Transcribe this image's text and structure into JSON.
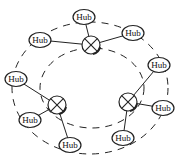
{
  "diagram": {
    "type": "network-topology",
    "colors": {
      "stroke": "#222222",
      "background": "#ffffff",
      "node_fill": "#ffffff"
    },
    "rings": [
      {
        "name": "outer-ring",
        "cx": 90,
        "cy": 88,
        "rx": 78,
        "ry": 66,
        "style": "dashed"
      },
      {
        "name": "inner-ring",
        "cx": 92,
        "cy": 88,
        "rx": 52,
        "ry": 40,
        "style": "dashed"
      }
    ],
    "switches": [
      {
        "id": "s-top",
        "x": 91,
        "y": 45
      },
      {
        "id": "s-left",
        "x": 57,
        "y": 105
      },
      {
        "id": "s-right",
        "x": 128,
        "y": 102
      }
    ],
    "hubs": [
      {
        "id": "h1",
        "label": "Hub",
        "x": 84,
        "y": 17,
        "switch": "s-top"
      },
      {
        "id": "h2",
        "label": "Hub",
        "x": 40,
        "y": 40,
        "switch": "s-top"
      },
      {
        "id": "h3",
        "label": "Hub",
        "x": 133,
        "y": 33,
        "switch": "s-top"
      },
      {
        "id": "h4",
        "label": "Hub",
        "x": 159,
        "y": 65,
        "switch": "s-right"
      },
      {
        "id": "h5",
        "label": "Hub",
        "x": 163,
        "y": 108,
        "switch": "s-right"
      },
      {
        "id": "h6",
        "label": "Hub",
        "x": 123,
        "y": 138,
        "switch": "s-right"
      },
      {
        "id": "h7",
        "label": "Hub",
        "x": 16,
        "y": 79,
        "switch": "s-left"
      },
      {
        "id": "h8",
        "label": "Hub",
        "x": 30,
        "y": 120,
        "switch": "s-left"
      },
      {
        "id": "h9",
        "label": "Hub",
        "x": 70,
        "y": 145,
        "switch": "s-left"
      }
    ]
  }
}
